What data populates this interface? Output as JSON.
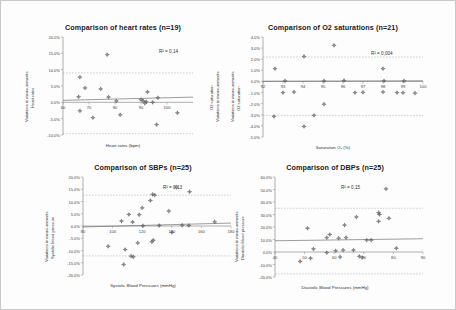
{
  "page": {
    "background": "#fdfdfd",
    "border_color": "#c9c9c9"
  },
  "chart_data": [
    {
      "id": "heart-rates",
      "type": "scatter",
      "title": "Comparison of heart rates (n=19)",
      "xlabel": "Heart rates (bpm)",
      "ylabel_line1": "Variations in measurements",
      "ylabel_line2": "Heart rates",
      "ylabel_right_line1": "Variations in measurements",
      "ylabel_right_line2": "O2 saturation",
      "annotation": "R² = 0,14",
      "xlim": [
        60,
        110
      ],
      "ylim": [
        -10,
        20
      ],
      "xticks": [
        60,
        70,
        80,
        90,
        100
      ],
      "yticks": [
        "20.0%",
        "15.0%",
        "10.0%",
        "5.0%",
        "0.0%",
        "-5.0%",
        "-10.0%"
      ],
      "ytick_values": [
        20,
        15,
        10,
        5,
        0,
        -5,
        -10
      ],
      "grid": false,
      "limit_lines": [
        9.0,
        -9.6
      ],
      "trend": {
        "y_at_xmin": 0.6,
        "y_at_xmax": 1.6
      },
      "points": [
        {
          "x": 66.5,
          "y": 7.7
        },
        {
          "x": 68.5,
          "y": 4.4
        },
        {
          "x": 66.0,
          "y": 1.7
        },
        {
          "x": 77.0,
          "y": 14.6
        },
        {
          "x": 74.5,
          "y": 4.1
        },
        {
          "x": 77.5,
          "y": 1.6
        },
        {
          "x": 80.5,
          "y": 0.4
        },
        {
          "x": 66.5,
          "y": -2.6
        },
        {
          "x": 71.5,
          "y": -4.7
        },
        {
          "x": 82.0,
          "y": -3.8
        },
        {
          "x": 92.5,
          "y": 3.2
        },
        {
          "x": 96.5,
          "y": 1.4
        },
        {
          "x": 90.0,
          "y": 0.8
        },
        {
          "x": 92.0,
          "y": 0.2
        },
        {
          "x": 94.5,
          "y": 0.0
        },
        {
          "x": 91.5,
          "y": -0.3
        },
        {
          "x": 96.0,
          "y": -6.8
        },
        {
          "x": 104.0,
          "y": -3.2
        },
        {
          "x": 90.8,
          "y": 0.5
        }
      ]
    },
    {
      "id": "o2-saturations",
      "type": "scatter",
      "title": "Comparison of O2 saturations (n=21)",
      "xlabel": "Saturation O₂ (%)",
      "ylabel_line1": "Variations in measurements",
      "ylabel_line2": "O2 saturation",
      "annotation": "R² = 0,004",
      "xlim": [
        92,
        100
      ],
      "ylim": [
        -5,
        4
      ],
      "xticks": [
        92,
        93,
        94,
        95,
        96,
        97,
        98,
        99,
        100
      ],
      "yticks": [
        "4.0%",
        "3.0%",
        "2.0%",
        "1.0%",
        "0.0%",
        "-1.0%",
        "-2.0%",
        "-3.0%",
        "-4.0%",
        "-5.0%"
      ],
      "ytick_values": [
        4,
        3,
        2,
        1,
        0,
        -1,
        -2,
        -3,
        -4,
        -5
      ],
      "grid": false,
      "limit_lines": [
        2.2,
        -3.05
      ],
      "trend": {
        "y_at_xmin": 0.02,
        "y_at_xmax": 0.06
      },
      "points": [
        {
          "x": 92.6,
          "y": 1.15
        },
        {
          "x": 93.1,
          "y": 0.05
        },
        {
          "x": 94.05,
          "y": 2.25
        },
        {
          "x": 95.55,
          "y": 3.25
        },
        {
          "x": 95.05,
          "y": 0.05
        },
        {
          "x": 96.05,
          "y": 0.08
        },
        {
          "x": 98.0,
          "y": 1.15
        },
        {
          "x": 98.05,
          "y": 0.05
        },
        {
          "x": 99.05,
          "y": 0.05
        },
        {
          "x": 93.55,
          "y": -0.95
        },
        {
          "x": 98.0,
          "y": -0.95
        },
        {
          "x": 98.7,
          "y": -1.0
        },
        {
          "x": 99.6,
          "y": -1.05
        },
        {
          "x": 95.05,
          "y": -2.05
        },
        {
          "x": 92.55,
          "y": -3.15
        },
        {
          "x": 94.55,
          "y": -3.05
        },
        {
          "x": 94.05,
          "y": -4.05
        },
        {
          "x": 97.0,
          "y": -0.98
        },
        {
          "x": 96.6,
          "y": -1.0
        },
        {
          "x": 99.0,
          "y": -1.02
        },
        {
          "x": 93.0,
          "y": -1.0
        }
      ]
    },
    {
      "id": "sbps",
      "type": "scatter",
      "title": "Comparison of SBPs (n=25)",
      "xlabel": "Systolic Blood Pressures (mmHg)",
      "ylabel_line1": "Variations in measurements",
      "ylabel_line2": "Systolic blood pressure",
      "annotation": "R² = 0,13",
      "xlim": [
        80,
        180
      ],
      "ylim": [
        -20,
        20
      ],
      "xticks": [
        80,
        100,
        120,
        140,
        160,
        180
      ],
      "yticks": [
        "20.0%",
        "15.0%",
        "10.0%",
        "5.0%",
        "0.0%",
        "-5.0%",
        "-10.0%",
        "-15.0%",
        "-20.0%"
      ],
      "ytick_values": [
        20,
        15,
        10,
        5,
        0,
        -5,
        -10,
        -15,
        -20
      ],
      "grid": false,
      "limit_lines": [
        12.6,
        -12.2
      ],
      "trend": {
        "y_at_xmin": -0.4,
        "y_at_xmax": 1.2
      },
      "points": [
        {
          "x": 143.0,
          "y": 15.9
        },
        {
          "x": 152.0,
          "y": 14.0
        },
        {
          "x": 128.5,
          "y": 12.6
        },
        {
          "x": 127.0,
          "y": 12.9
        },
        {
          "x": 125.5,
          "y": 10.4
        },
        {
          "x": 120.0,
          "y": 7.4
        },
        {
          "x": 138.0,
          "y": 6.1
        },
        {
          "x": 111.0,
          "y": 4.7
        },
        {
          "x": 118.0,
          "y": 4.6
        },
        {
          "x": 106.0,
          "y": 2.0
        },
        {
          "x": 113.5,
          "y": 1.6
        },
        {
          "x": 120.5,
          "y": 0.1
        },
        {
          "x": 131.5,
          "y": 0.2
        },
        {
          "x": 147.0,
          "y": 0.3
        },
        {
          "x": 151.5,
          "y": 0.2
        },
        {
          "x": 169.0,
          "y": 1.7
        },
        {
          "x": 140.0,
          "y": -2.6
        },
        {
          "x": 127.5,
          "y": -5.8
        },
        {
          "x": 126.5,
          "y": -6.4
        },
        {
          "x": 117.0,
          "y": -6.9
        },
        {
          "x": 97.0,
          "y": -8.3
        },
        {
          "x": 108.5,
          "y": -9.6
        },
        {
          "x": 112.5,
          "y": -12.3
        },
        {
          "x": 114.0,
          "y": -12.6
        },
        {
          "x": 107.5,
          "y": -15.7
        }
      ]
    },
    {
      "id": "dbps",
      "type": "scatter",
      "title": "Comparison of DBPs (n=25)",
      "xlabel": "Diastolic Blood Pressures (mmHg)",
      "ylabel_line1": "Variations in measurements",
      "ylabel_line2": "Diastolic blood pressure",
      "annotation": "R² = 0,15",
      "xlim": [
        40,
        90
      ],
      "ylim": [
        -20,
        60
      ],
      "xticks": [
        40,
        50,
        60,
        70,
        80,
        90
      ],
      "yticks": [
        "60.0%",
        "50.0%",
        "40.0%",
        "30.0%",
        "20.0%",
        "10.0%",
        "0.0%",
        "-10.0%",
        "-20.0%"
      ],
      "ytick_values": [
        60,
        50,
        40,
        30,
        20,
        10,
        0,
        -10,
        -20
      ],
      "grid": false,
      "limit_lines": [
        35.0,
        -17.5
      ],
      "trend": {
        "y_at_xmin": 9.0,
        "y_at_xmax": 10.6
      },
      "points": [
        {
          "x": 77.5,
          "y": 50.5
        },
        {
          "x": 75.0,
          "y": 31.5
        },
        {
          "x": 75.3,
          "y": 30.0
        },
        {
          "x": 78.5,
          "y": 27.0
        },
        {
          "x": 75.0,
          "y": 24.5
        },
        {
          "x": 67.5,
          "y": 28.0
        },
        {
          "x": 63.5,
          "y": 21.5
        },
        {
          "x": 51.0,
          "y": 19.0
        },
        {
          "x": 58.5,
          "y": 14.0
        },
        {
          "x": 57.5,
          "y": 11.5
        },
        {
          "x": 61.5,
          "y": 11.0
        },
        {
          "x": 64.0,
          "y": 11.5
        },
        {
          "x": 71.0,
          "y": 9.5
        },
        {
          "x": 72.5,
          "y": 9.5
        },
        {
          "x": 53.0,
          "y": 2.5
        },
        {
          "x": 60.5,
          "y": 1.0
        },
        {
          "x": 63.0,
          "y": 1.5
        },
        {
          "x": 66.5,
          "y": 1.5
        },
        {
          "x": 81.0,
          "y": 3.0
        },
        {
          "x": 57.5,
          "y": -0.5
        },
        {
          "x": 68.5,
          "y": -3.5
        },
        {
          "x": 69.5,
          "y": -4.5
        },
        {
          "x": 62.0,
          "y": -4.0
        },
        {
          "x": 52.0,
          "y": -5.0
        },
        {
          "x": 48.5,
          "y": -7.5
        }
      ]
    }
  ]
}
